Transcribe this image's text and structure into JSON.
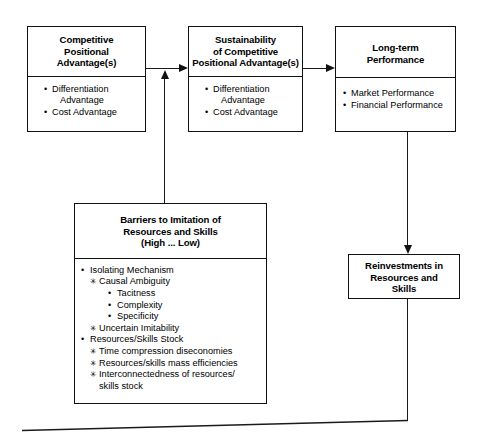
{
  "diagram": {
    "line_color": "#111111",
    "background": "#ffffff"
  },
  "boxes": {
    "competitive_positional_advantage": {
      "title": "Competitive\nPositional\nAdvantage(s)",
      "title_lines": [
        "Competitive",
        "Positional",
        "Advantage(s)"
      ],
      "items": [
        {
          "marker": "•",
          "text": "Differentiation",
          "continuation": "Advantage"
        },
        {
          "marker": "•",
          "text": "Cost Advantage",
          "continuation": ""
        }
      ]
    },
    "sustainability_of_competitive_positional_advantage": {
      "title_lines": [
        "Sustainability",
        "of Competitive",
        "Positional Advantage(s)"
      ],
      "items": [
        {
          "marker": "•",
          "text": "Differentiation",
          "continuation": "Advantage"
        },
        {
          "marker": "•",
          "text": "Cost Advantage",
          "continuation": ""
        }
      ]
    },
    "long_term_performance": {
      "title_lines": [
        "Long-term",
        "Performance"
      ],
      "items": [
        {
          "marker": "•",
          "text": "Market Performance",
          "continuation": ""
        },
        {
          "marker": "•",
          "text": "Financial Performance",
          "continuation": ""
        }
      ]
    },
    "barriers_to_imitation": {
      "title_lines": [
        "Barriers to Imitation of",
        "Resources and Skills",
        "(High ... Low)"
      ],
      "items": [
        {
          "level": 1,
          "marker": "•",
          "text": "Isolating Mechanism"
        },
        {
          "level": 2,
          "marker": "✳",
          "text": "Causal Ambiguity"
        },
        {
          "level": 3,
          "marker": "•",
          "text": "Tacitness"
        },
        {
          "level": 3,
          "marker": "•",
          "text": "Complexity"
        },
        {
          "level": 3,
          "marker": "•",
          "text": "Specificity"
        },
        {
          "level": 2,
          "marker": "✳",
          "text": "Uncertain Imitability"
        },
        {
          "level": 1,
          "marker": "•",
          "text": "Resources/Skills Stock"
        },
        {
          "level": 2,
          "marker": "✳",
          "text": "Time compression diseconomies"
        },
        {
          "level": 2,
          "marker": "✳",
          "text": "Resources/skills mass efficiencies"
        },
        {
          "level": 2,
          "marker": "✳",
          "text": "Interconnectedness of resources/",
          "continuation": "skills stock"
        }
      ]
    },
    "reinvestments": {
      "title_lines": [
        "Reinvestments in",
        "Resources and",
        "Skills"
      ]
    }
  },
  "connectors": [
    {
      "name": "cpa-to-sustainability",
      "type": "arrow-right"
    },
    {
      "name": "sustainability-to-performance",
      "type": "arrow-right"
    },
    {
      "name": "barriers-to-sustainability",
      "type": "arrow-up"
    },
    {
      "name": "performance-to-reinvestments",
      "type": "arrow-down"
    },
    {
      "name": "reinvestments-feedback-loop",
      "type": "line"
    }
  ]
}
